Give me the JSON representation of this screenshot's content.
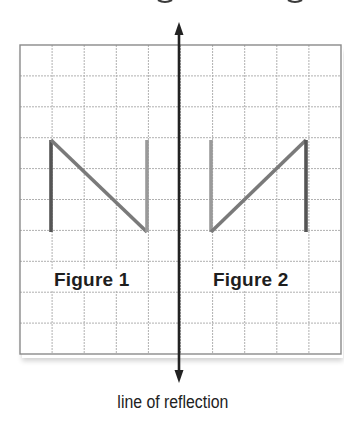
{
  "diagram": {
    "type": "reflection-on-grid",
    "grid": {
      "columns": 10,
      "rows": 10,
      "left": 20,
      "top": 45,
      "right": 341,
      "bottom": 354,
      "line_color": "#b0b0b0",
      "border_color": "#8a8a8a"
    },
    "line_of_reflection": {
      "x": 179,
      "y_top": 22,
      "y_bottom": 383,
      "color": "#222222",
      "arrows": "both",
      "label": "line of reflection"
    },
    "figures": [
      {
        "name": "Figure 1",
        "label": "Figure 1",
        "segments": [
          {
            "role": "left-vertical",
            "from": [
              51,
              140
            ],
            "to": [
              51,
              232
            ],
            "color": "#555555"
          },
          {
            "role": "diagonal",
            "from": [
              51,
              140
            ],
            "to": [
              147,
              232
            ],
            "color": "#7a7a7a"
          },
          {
            "role": "right-vertical",
            "from": [
              147,
              140
            ],
            "to": [
              147,
              232
            ],
            "color": "#9a9a9a"
          }
        ]
      },
      {
        "name": "Figure 2",
        "label": "Figure 2",
        "segments": [
          {
            "role": "left-vertical",
            "from": [
              211,
              140
            ],
            "to": [
              211,
              232
            ],
            "color": "#9a9a9a"
          },
          {
            "role": "diagonal",
            "from": [
              211,
              232
            ],
            "to": [
              306,
              140
            ],
            "color": "#7a7a7a"
          },
          {
            "role": "right-vertical",
            "from": [
              306,
              140
            ],
            "to": [
              306,
              232
            ],
            "color": "#555555"
          }
        ]
      }
    ]
  },
  "labels": {
    "figure1": "Figure 1",
    "figure2": "Figure 2",
    "caption": "line of reflection"
  }
}
